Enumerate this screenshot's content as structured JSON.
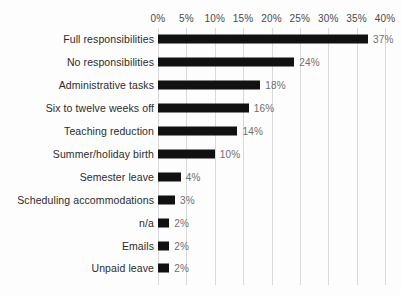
{
  "chart_data": {
    "type": "bar",
    "orientation": "horizontal",
    "title": "",
    "subtitle": "",
    "xlabel": "",
    "ylabel": "",
    "xlim": [
      0,
      40
    ],
    "grid": true,
    "legend": null,
    "value_suffix": "%",
    "categories": [
      "Full responsibilities",
      "No responsibilities",
      "Administrative tasks",
      "Six to twelve weeks off",
      "Teaching reduction",
      "Summer/holiday birth",
      "Semester leave",
      "Scheduling accommodations",
      "n/a",
      "Emails",
      "Unpaid leave"
    ],
    "values": [
      37,
      24,
      18,
      16,
      14,
      10,
      4,
      3,
      2,
      2,
      2
    ],
    "value_labels": [
      "37%",
      "24%",
      "18%",
      "16%",
      "14%",
      "10%",
      "4%",
      "3%",
      "2%",
      "2%",
      "2%"
    ],
    "xticks": [
      0,
      5,
      10,
      15,
      20,
      25,
      30,
      35,
      40
    ],
    "xtick_labels": [
      "0%",
      "5%",
      "10%",
      "15%",
      "20%",
      "25%",
      "30%",
      "35%",
      "40%"
    ],
    "colors": {
      "bar": "#111111",
      "gridline": "#d9d9d9",
      "background": "#fdfdfd",
      "category_text": "#2b2b2b",
      "value_text": "#6e6e6e",
      "axis_text": "#4a4a4a"
    }
  }
}
